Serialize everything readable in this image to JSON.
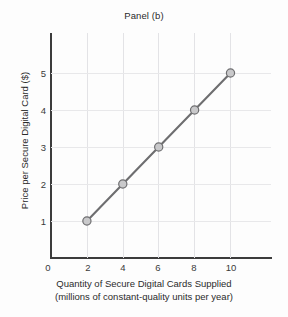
{
  "chart_data": {
    "type": "line",
    "title": "Panel (b)",
    "xlabel": "Quantity of Secure Digital Cards Supplied",
    "xlabel_line2": "(millions of constant-quality units per year)",
    "ylabel": "Price per Secure Digital Card ($)",
    "x": [
      2,
      4,
      6,
      8,
      10
    ],
    "values": [
      1,
      2,
      3,
      4,
      5
    ],
    "series": [
      {
        "name": "Supply",
        "x": [
          2,
          4,
          6,
          8,
          10
        ],
        "values": [
          1,
          2,
          3,
          4,
          5
        ]
      }
    ],
    "xlim": [
      0,
      12.2
    ],
    "ylim": [
      0,
      6.1
    ],
    "xticks": [
      0,
      2,
      4,
      6,
      8,
      10
    ],
    "xticklabels": [
      "0",
      "2",
      "4",
      "6",
      "8",
      "10"
    ],
    "yticks": [
      1,
      2,
      3,
      4,
      5
    ],
    "yticklabels": [
      "1",
      "2",
      "3",
      "4",
      "5"
    ],
    "grid": true,
    "legend": "none",
    "marker": "circle",
    "colors": {
      "line": "#6e6e70",
      "marker_fill": "#c9c9cb",
      "marker_edge": "#6e6e70",
      "grid": "#e5e5e8",
      "axis": "#3c3c3c",
      "text": "#2b2b2b",
      "background": "#fdfdfd"
    }
  }
}
